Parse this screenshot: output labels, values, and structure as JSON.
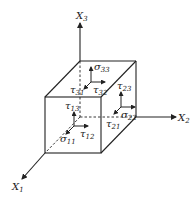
{
  "diagram": {
    "axes": [
      {
        "id": "x1",
        "label": "X",
        "sub": "1"
      },
      {
        "id": "x2",
        "label": "X",
        "sub": "2"
      },
      {
        "id": "x3",
        "label": "X",
        "sub": "3"
      }
    ],
    "stresses": [
      {
        "id": "s33",
        "sym": "σ",
        "sub": "33"
      },
      {
        "id": "t32",
        "sym": "τ",
        "sub": "32"
      },
      {
        "id": "t31",
        "sym": "τ",
        "sub": "31"
      },
      {
        "id": "t23",
        "sym": "τ",
        "sub": "23"
      },
      {
        "id": "s22",
        "sym": "σ",
        "sub": "22"
      },
      {
        "id": "t21",
        "sym": "τ",
        "sub": "21"
      },
      {
        "id": "t13",
        "sym": "τ",
        "sub": "13"
      },
      {
        "id": "t12",
        "sym": "τ",
        "sub": "12"
      },
      {
        "id": "s11",
        "sym": "σ",
        "sub": "11"
      }
    ],
    "colors": {
      "ink": "#222222",
      "background": "#ffffff"
    }
  }
}
